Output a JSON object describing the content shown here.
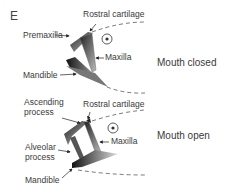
{
  "panel_letter": "E",
  "top": {
    "state_label": "Mouth closed",
    "labels": {
      "rostral_cartilage": "Rostral cartilage",
      "premaxilla": "Premaxilla",
      "maxilla": "Maxilla",
      "mandible": "Mandible"
    }
  },
  "bottom": {
    "state_label": "Mouth open",
    "labels": {
      "ascending_process_1": "Ascending",
      "ascending_process_2": "process",
      "rostral_cartilage": "Rostral cartilage",
      "maxilla": "Maxilla",
      "alveolar_process_1": "Alveolar",
      "alveolar_process_2": "process",
      "mandible": "Mandible"
    }
  }
}
